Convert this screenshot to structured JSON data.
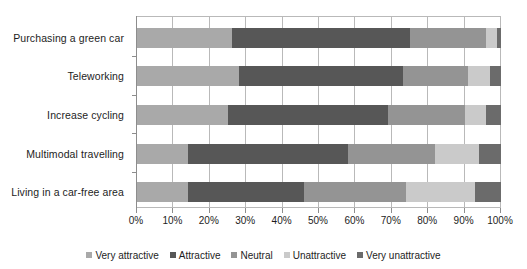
{
  "chart_data": {
    "type": "bar",
    "orientation": "horizontal",
    "stacked": true,
    "normalized_percent": true,
    "title": "",
    "subtitle": "",
    "xlabel": "",
    "ylabel": "",
    "xlim": [
      0,
      100
    ],
    "xticks": [
      "0%",
      "10%",
      "20%",
      "30%",
      "40%",
      "50%",
      "60%",
      "70%",
      "80%",
      "90%",
      "100%"
    ],
    "xtick_values": [
      0,
      10,
      20,
      30,
      40,
      50,
      60,
      70,
      80,
      90,
      100
    ],
    "grid": "vertical",
    "legend_position": "bottom",
    "categories": [
      "Purchasing a green car",
      "Teleworking",
      "Increase cycling",
      "Multimodal travelling",
      "Living in a car-free area"
    ],
    "series": [
      {
        "name": "Very attractive",
        "color": "#a9a9a9",
        "values": [
          26,
          28,
          25,
          14,
          14
        ]
      },
      {
        "name": "Attractive",
        "color": "#575757",
        "values": [
          49,
          45,
          44,
          44,
          32
        ]
      },
      {
        "name": "Neutral",
        "color": "#949494",
        "values": [
          21,
          18,
          21,
          24,
          28
        ]
      },
      {
        "name": "Unattractive",
        "color": "#cacaca",
        "values": [
          3,
          6,
          6,
          12,
          19
        ]
      },
      {
        "name": "Very unattractive",
        "color": "#6b6b6b",
        "values": [
          1,
          3,
          4,
          6,
          7
        ]
      }
    ]
  }
}
